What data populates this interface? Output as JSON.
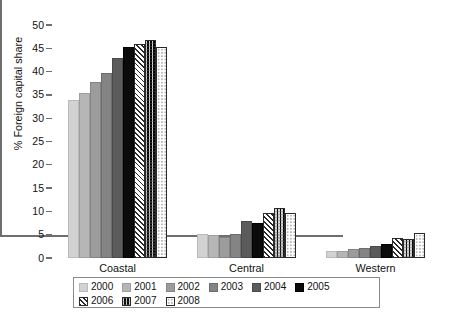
{
  "chart_data": {
    "type": "bar",
    "title": "",
    "xlabel": "",
    "ylabel": "% Foreign capital share",
    "ylim": [
      0,
      50
    ],
    "yticks": [
      0,
      5,
      10,
      15,
      20,
      25,
      30,
      35,
      40,
      45,
      50
    ],
    "grid": false,
    "legend_position": "bottom",
    "categories": [
      "Coastal",
      "Central",
      "Western"
    ],
    "series": [
      {
        "name": "2000",
        "pattern": "solid-light-gray",
        "color": "#d2d2d2",
        "values": [
          34.0,
          5.2,
          1.5
        ]
      },
      {
        "name": "2001",
        "pattern": "solid-gray",
        "color": "#b6b6b6",
        "values": [
          35.5,
          5.0,
          1.5
        ]
      },
      {
        "name": "2002",
        "pattern": "solid-mid-gray",
        "color": "#9c9c9c",
        "values": [
          37.8,
          4.6,
          2.0
        ]
      },
      {
        "name": "2003",
        "pattern": "solid-dark-gray",
        "color": "#848484",
        "values": [
          39.8,
          5.1,
          2.2
        ]
      },
      {
        "name": "2004",
        "pattern": "solid-darker-gray",
        "color": "#5b5b5b",
        "values": [
          43.0,
          8.0,
          2.6
        ]
      },
      {
        "name": "2005",
        "pattern": "solid-black",
        "color": "#0b0b0b",
        "values": [
          45.2,
          7.5,
          3.1
        ]
      },
      {
        "name": "2006",
        "pattern": "diagonal-hatch",
        "color": "#ffffff",
        "values": [
          46.0,
          9.7,
          4.4
        ]
      },
      {
        "name": "2007",
        "pattern": "checkerboard",
        "color": "#ffffff",
        "values": [
          46.8,
          10.8,
          4.1
        ]
      },
      {
        "name": "2008",
        "pattern": "dotted",
        "color": "#ffffff",
        "values": [
          45.2,
          9.7,
          5.3
        ]
      }
    ]
  },
  "axis": {
    "y_title": "% Foreign capital share"
  },
  "caption": {
    "text": ""
  }
}
